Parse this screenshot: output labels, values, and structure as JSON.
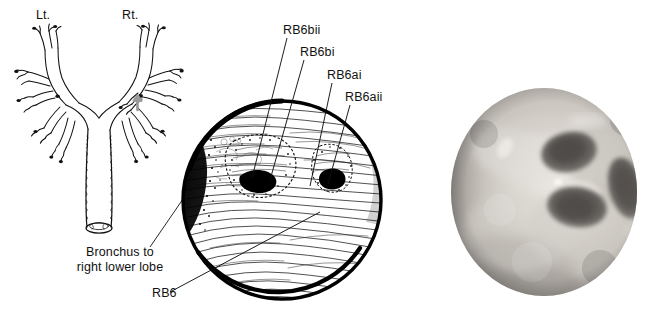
{
  "figure": {
    "caption_absent": true,
    "background_color": "#ffffff",
    "ink_color": "#111111"
  },
  "panels": {
    "bronchial_tree": {
      "name": "bronchial-tree-diagram",
      "labels": {
        "left_side": "Lt.",
        "right_side": "Rt.",
        "callout_line1": "Bronchus to",
        "callout_line2": "right lower lobe",
        "callout_full": "Bronchus to right lower lobe"
      },
      "marker": {
        "type": "arrow-up",
        "color": "#999999",
        "points_to": "right lower lobe bronchus"
      }
    },
    "endoscopic_drawing": {
      "name": "endoscopic-line-drawing",
      "shape": "circle",
      "shading": "hatched-horizontal-lines",
      "dark_regions": [
        "left-wall-shadow",
        "upper-orifice",
        "lower-orifice"
      ],
      "labels": [
        {
          "id": "rb6bii",
          "text": "RB6bii"
        },
        {
          "id": "rb6bi",
          "text": "RB6bi"
        },
        {
          "id": "rb6ai",
          "text": "RB6ai"
        },
        {
          "id": "rb6aii",
          "text": "RB6aii"
        },
        {
          "id": "rb6",
          "text": "RB6"
        }
      ]
    },
    "bronchoscopy_photo": {
      "name": "bronchoscopy-photograph",
      "shape": "circle",
      "tone": "grayscale",
      "description_absent": true
    }
  },
  "colors": {
    "ink": "#111111",
    "gray_arrow": "#9a9a9a",
    "photo_mid": "#b9b6b2",
    "photo_dark": "#5d5a57",
    "photo_light": "#e3e0dc"
  }
}
